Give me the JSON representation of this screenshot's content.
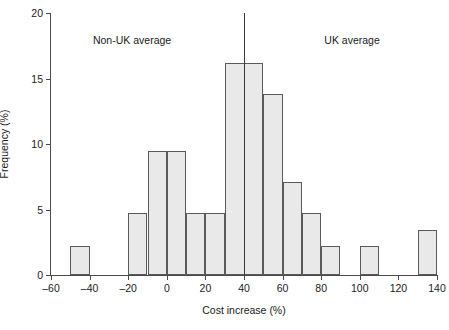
{
  "chart_data": {
    "type": "bar",
    "title": "",
    "subtitle": "",
    "xlabel": "Cost increase (%)",
    "ylabel": "Frequency (%)",
    "xlim": [
      -60,
      140
    ],
    "ylim": [
      0,
      20
    ],
    "grid": false,
    "legend": null,
    "xticks": [
      -60,
      -40,
      -20,
      0,
      20,
      40,
      60,
      80,
      100,
      120,
      140
    ],
    "xtick_labels": [
      "–60",
      "–40",
      "–20",
      "0",
      "20",
      "40",
      "60",
      "80",
      "100",
      "120",
      "140"
    ],
    "yticks": [
      0,
      5,
      10,
      15,
      20
    ],
    "ytick_labels": [
      "0",
      "5",
      "10",
      "15",
      "20"
    ],
    "bins": [
      {
        "x0": -50,
        "x1": -40,
        "value": 2.2
      },
      {
        "x0": -20,
        "x1": -10,
        "value": 4.7
      },
      {
        "x0": -10,
        "x1": 0,
        "value": 9.5
      },
      {
        "x0": 0,
        "x1": 10,
        "value": 9.5
      },
      {
        "x0": 10,
        "x1": 20,
        "value": 4.7
      },
      {
        "x0": 20,
        "x1": 30,
        "value": 4.7
      },
      {
        "x0": 30,
        "x1": 50,
        "value": 16.2
      },
      {
        "x0": 50,
        "x1": 60,
        "value": 13.8
      },
      {
        "x0": 60,
        "x1": 70,
        "value": 7.1
      },
      {
        "x0": 70,
        "x1": 80,
        "value": 4.7
      },
      {
        "x0": 80,
        "x1": 90,
        "value": 2.2
      },
      {
        "x0": 100,
        "x1": 110,
        "value": 2.2
      },
      {
        "x0": 130,
        "x1": 140,
        "value": 3.4
      }
    ],
    "categories": [
      "-50–-40",
      "-20–-10",
      "-10–0",
      "0–10",
      "10–20",
      "20–30",
      "30–50",
      "50–60",
      "60–70",
      "70–80",
      "80–90",
      "100–110",
      "130–140"
    ],
    "values": [
      2.2,
      4.7,
      9.5,
      9.5,
      4.7,
      4.7,
      16.2,
      13.8,
      7.1,
      4.7,
      2.2,
      2.2,
      3.4
    ],
    "reference_lines": [
      {
        "name": "uk-average-divider",
        "orientation": "vertical",
        "x": 40
      }
    ],
    "annotations": [
      {
        "name": "non-uk-average-label",
        "text": "Non-UK average",
        "x": -18,
        "y": 18.3
      },
      {
        "name": "uk-average-label",
        "text": "UK average",
        "x": 96,
        "y": 18.3
      }
    ],
    "colors": {
      "bar_fill": "#e9e9e9",
      "bar_stroke": "#5a5a5a",
      "axis": "#4a4a4a",
      "reference_line": "#3a3a3a",
      "text": "#1a1a1a",
      "background": "#ffffff"
    }
  }
}
